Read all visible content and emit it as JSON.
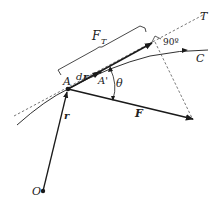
{
  "diagram": {
    "type": "vector force diagram",
    "labels": {
      "origin": "O",
      "point_a": "A",
      "point_a_prime": "A'",
      "position_vector": "r",
      "displacement": "dr",
      "displacement_d": "d",
      "displacement_r": "r",
      "force": "F",
      "tangential_force": "F",
      "tangential_force_sub": "T",
      "tangent_line": "T",
      "curve": "C",
      "angle": "θ",
      "right_angle": "90º"
    },
    "colors": {
      "stroke": "#1a1a1a",
      "dashed": "#555555",
      "background": "#ffffff"
    }
  }
}
